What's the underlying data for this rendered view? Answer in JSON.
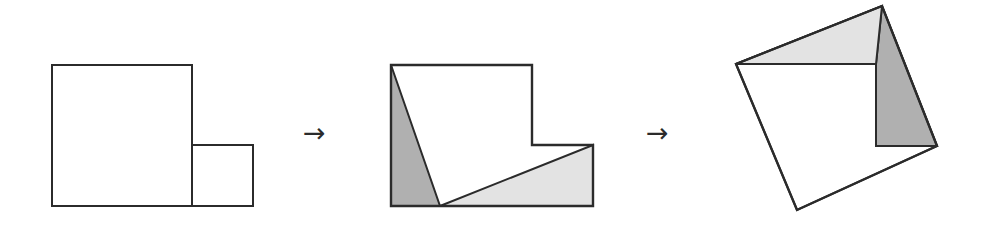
{
  "figure": {
    "background_color": "#ffffff",
    "stroke_color": "#2b2b2b",
    "stroke_width": 2,
    "fill_white": "#ffffff",
    "fill_dark_gray": "#b0b0b0",
    "fill_light_gray": "#e3e3e3",
    "width": 985,
    "height": 228
  },
  "panels": [
    {
      "id": "panel-one",
      "name": "two-squares",
      "caption": "",
      "shapes": [
        {
          "id": "large-square",
          "name": "large-square",
          "fill": "#ffffff",
          "points": "52,65 192,65 192,206 52,206"
        },
        {
          "id": "small-square",
          "name": "small-square",
          "fill": "#ffffff",
          "points": "192,145 253,145 253,206 192,206"
        }
      ]
    },
    {
      "id": "panel-two",
      "name": "l-shape-dissected",
      "caption": "",
      "shapes": [
        {
          "id": "l-shape-body",
          "name": "l-shape-outline",
          "fill": "#ffffff",
          "points": "391,65 532,65 532,145 593,145 593,206 391,206"
        },
        {
          "id": "dark-triangle-flat",
          "name": "dark-triangle",
          "fill": "#b0b0b0",
          "points": "391,65 391,206 440,206"
        },
        {
          "id": "light-triangle-flat",
          "name": "light-triangle",
          "fill": "#e3e3e3",
          "points": "440,206 593,206 593,145"
        }
      ],
      "cut_lines": [
        {
          "id": "cut-line-dark",
          "name": "cut-line-dark",
          "x1": 391,
          "y1": 65,
          "x2": 440,
          "y2": 206
        },
        {
          "id": "cut-line-light",
          "name": "cut-line-light",
          "x1": 440,
          "y1": 206,
          "x2": 593,
          "y2": 145
        }
      ]
    },
    {
      "id": "panel-three",
      "name": "rotated-square-assembled",
      "caption": "",
      "shapes": [
        {
          "id": "rotated-square",
          "name": "rotated-square-outline",
          "fill": "#ffffff",
          "points": "736,64 882,6 937,146 797,210"
        },
        {
          "id": "dark-triangle-rotated",
          "name": "dark-triangle",
          "fill": "#b0b0b0",
          "points": "876,64 882,6 937,146 876,146"
        },
        {
          "id": "light-triangle-rotated",
          "name": "light-triangle",
          "fill": "#e3e3e3",
          "points": "736,64 882,6 876,64"
        }
      ],
      "cut_lines": [
        {
          "id": "seam-horizontal",
          "name": "seam-horizontal",
          "x1": 736,
          "y1": 64,
          "x2": 876,
          "y2": 64
        },
        {
          "id": "seam-vertical",
          "name": "seam-vertical",
          "x1": 876,
          "y1": 64,
          "x2": 876,
          "y2": 146
        },
        {
          "id": "seam-diagonal",
          "name": "seam-diagonal",
          "x1": 876,
          "y1": 146,
          "x2": 937,
          "y2": 146
        }
      ]
    }
  ],
  "arrows": [
    {
      "id": "arrow-one",
      "name": "arrow-right-first",
      "glyph": "→"
    },
    {
      "id": "arrow-two",
      "name": "arrow-right-second",
      "glyph": "→"
    }
  ]
}
